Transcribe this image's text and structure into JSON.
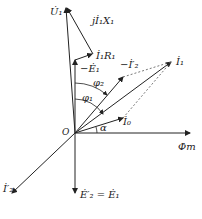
{
  "diagram": {
    "type": "phasor-diagram",
    "origin_label": "O",
    "labels": {
      "U1": "U̇₁",
      "jI1X1": "jİ₁X₁",
      "I1R1": "İ₁R₁",
      "minusE1": "−Ė₁",
      "minusI2p": "−İ′₂",
      "I1": "İ₁",
      "phi2": "φ₂",
      "phi1": "φ₁",
      "alpha": "α",
      "I0": "İ₀",
      "Phim": "Φ̇m",
      "I2p": "İ′₂",
      "E2p_eq_E1": "Ė′₂ = Ė₁"
    },
    "colors": {
      "line": "#222222",
      "dashed": "#555555"
    }
  }
}
